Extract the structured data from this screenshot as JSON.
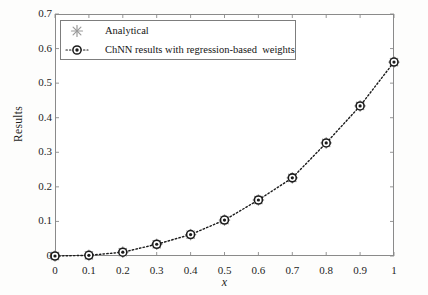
{
  "chart_data": {
    "type": "line",
    "title": "",
    "xlabel": "x",
    "ylabel": "Results",
    "xlim": [
      0,
      1
    ],
    "ylim": [
      0,
      0.7
    ],
    "grid": false,
    "legend_position": "upper left inside axes",
    "x": [
      0,
      0.1,
      0.2,
      0.3,
      0.4,
      0.5,
      0.6,
      0.7,
      0.8,
      0.9,
      1
    ],
    "xticks": [
      "0",
      "0.1",
      "0.2",
      "0.3",
      "0.4",
      "0.5",
      "0.6",
      "0.7",
      "0.8",
      "0.9",
      "1"
    ],
    "xtick_values": [
      0,
      0.1,
      0.2,
      0.3,
      0.4,
      0.5,
      0.6,
      0.7,
      0.8,
      0.9,
      1
    ],
    "yticks": [
      "0",
      "0.1",
      "0.2",
      "0.3",
      "0.4",
      "0.5",
      "0.6",
      "0.7"
    ],
    "ytick_values": [
      0,
      0.1,
      0.2,
      0.3,
      0.4,
      0.5,
      0.6,
      0.7
    ],
    "series": [
      {
        "name": "Analytical",
        "marker": "asterisk",
        "marker_color": "#9a9a9a",
        "line_style": "none",
        "values": [
          0,
          0.002,
          0.011,
          0.034,
          0.062,
          0.104,
          0.162,
          0.226,
          0.327,
          0.434,
          0.561
        ]
      },
      {
        "name": "ChNN results with regression-based  weights",
        "marker": "circle",
        "marker_color": "#1b1b1b",
        "line_style": "dotted",
        "values": [
          0,
          0.002,
          0.011,
          0.034,
          0.062,
          0.104,
          0.162,
          0.226,
          0.327,
          0.434,
          0.561
        ]
      }
    ]
  },
  "legend": {
    "entries": [
      {
        "label": "Analytical"
      },
      {
        "label": "ChNN results with regression-based  weights"
      }
    ]
  },
  "colors": {
    "axis": "#8a8a8a",
    "text": "#1d1d1d",
    "analytical_marker": "#9a9a9a",
    "chnn_marker": "#1b1b1b",
    "plot_background": "#ffffff",
    "page_background": "#fdfdfc"
  }
}
